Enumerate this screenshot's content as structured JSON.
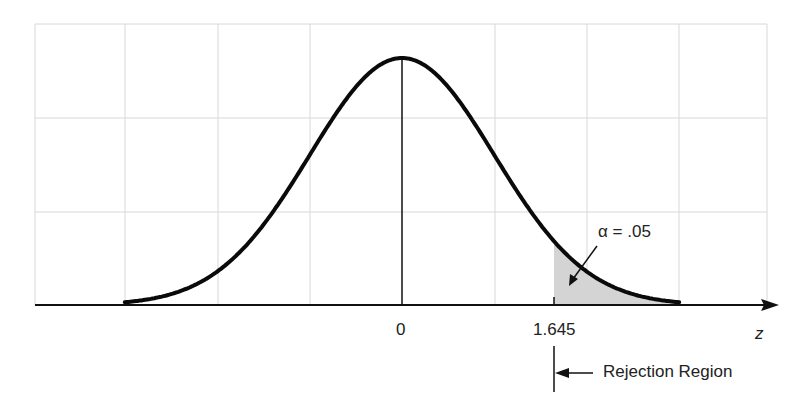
{
  "chart_data": {
    "type": "area",
    "title": "",
    "xlabel": "z",
    "ylabel": "",
    "xlim": [
      -3.4,
      3.96
    ],
    "x_ticks": [
      {
        "value": 0,
        "label": "0"
      },
      {
        "value": 1.645,
        "label": "1.645"
      }
    ],
    "series": [
      {
        "name": "standard normal density",
        "mean": 0,
        "sd": 1,
        "x_range": [
          -3,
          3
        ]
      }
    ],
    "shaded_region": {
      "from": 1.645,
      "to": 3,
      "area": 0.05,
      "color": "#d4d4d4"
    },
    "grid": true,
    "annotations": [
      {
        "text": "α = .05",
        "target": "shaded tail area"
      },
      {
        "text": "Rejection Region",
        "marker": "left arrow starting at z = 1.645"
      }
    ]
  },
  "labels": {
    "zero": "0",
    "critical": "1.645",
    "axis": "z",
    "alpha": "α = .05",
    "rejection": "Rejection Region"
  },
  "colors": {
    "curve": "#0a0a0a",
    "grid": "#d8d8d8",
    "shade": "#d4d4d4"
  }
}
